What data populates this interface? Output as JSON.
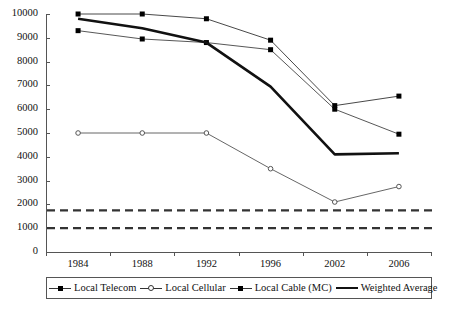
{
  "chart_data": {
    "type": "line",
    "title": "",
    "xlabel": "",
    "ylabel": "",
    "categories": [
      "1984",
      "1988",
      "1992",
      "1996",
      "2002",
      "2006"
    ],
    "ylim": [
      0,
      10000
    ],
    "yticks": [
      0,
      1000,
      2000,
      3000,
      4000,
      5000,
      6000,
      7000,
      8000,
      9000,
      10000
    ],
    "ytick_labels": [
      "0",
      "1000",
      "2000",
      "3000",
      "4000",
      "5000",
      "6000",
      "7000",
      "8000",
      "9000",
      "10000"
    ],
    "grid": false,
    "legend_position": "bottom",
    "series": [
      {
        "name": "Local Telecom",
        "marker": "filled-square",
        "line": "solid-thin",
        "color": "#333333",
        "values": [
          10000,
          10000,
          9800,
          8900,
          6150,
          6550
        ]
      },
      {
        "name": "Local Cellular",
        "marker": "open-circle",
        "line": "solid-thin",
        "color": "#555555",
        "values": [
          5000,
          5000,
          5000,
          3500,
          2100,
          2750
        ]
      },
      {
        "name": "Local Cable (MC)",
        "marker": "filled-square",
        "line": "solid-thin",
        "color": "#444444",
        "values": [
          9300,
          8950,
          8800,
          8500,
          6000,
          4950
        ]
      },
      {
        "name": "Weighted Average",
        "marker": "none",
        "line": "solid-thick",
        "color": "#111111",
        "values": [
          9800,
          9400,
          8800,
          6950,
          4100,
          4150
        ]
      }
    ],
    "reference_lines": [
      {
        "name": "upper-dashed-reference",
        "value": 1750,
        "style": "dashed",
        "color": "#333333"
      },
      {
        "name": "lower-dashed-reference",
        "value": 1000,
        "style": "dashed",
        "color": "#333333"
      }
    ]
  }
}
